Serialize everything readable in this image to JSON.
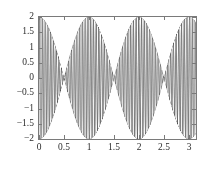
{
  "chart_data": {
    "type": "line",
    "title": "",
    "subtitle": "",
    "xlabel": "",
    "ylabel": "",
    "xlim": [
      0,
      3.141592653589793
    ],
    "ylim": [
      -2,
      2
    ],
    "grid": false,
    "legend": null,
    "envelope": {
      "formula": "2*cos(pi*x)",
      "amplitude": 2,
      "node_x": [
        0.5,
        1.5,
        2.5
      ],
      "antinode_x": [
        0,
        1,
        2,
        3
      ],
      "antinode_y": [
        2,
        2,
        2,
        2
      ]
    },
    "carrier": {
      "formula": "sin(200*x)",
      "relative_frequency": 200
    },
    "series": [
      {
        "name": "y = 2*cos(pi*x)*sin(200*x)",
        "color": "#3a3a3a",
        "x": [
          0,
          0.25,
          0.5,
          0.75,
          1,
          1.25,
          1.5,
          1.75,
          2,
          2.25,
          2.5,
          2.75,
          3,
          3.1416
        ],
        "envelope_upper": [
          2,
          1.414,
          0,
          1.414,
          2,
          1.414,
          0,
          1.414,
          2,
          1.414,
          0,
          1.414,
          2,
          2
        ],
        "envelope_lower": [
          -2,
          -1.414,
          0,
          -1.414,
          -2,
          -1.414,
          0,
          -1.414,
          -2,
          -1.414,
          0,
          -1.414,
          -2,
          -2
        ]
      }
    ],
    "xticks": [
      {
        "value": 0,
        "label": "0"
      },
      {
        "value": 0.5,
        "label": "0.5"
      },
      {
        "value": 1,
        "label": "1"
      },
      {
        "value": 1.5,
        "label": "1.5"
      },
      {
        "value": 2,
        "label": "2"
      },
      {
        "value": 2.5,
        "label": "2.5"
      },
      {
        "value": 3,
        "label": "3"
      }
    ],
    "yticks": [
      {
        "value": 2,
        "label": "2"
      },
      {
        "value": 1.5,
        "label": "1.5"
      },
      {
        "value": 1,
        "label": "1"
      },
      {
        "value": 0.5,
        "label": "0.5"
      },
      {
        "value": 0,
        "label": "0"
      },
      {
        "value": -0.5,
        "label": "−0.5"
      },
      {
        "value": -1,
        "label": "−1"
      },
      {
        "value": -1.5,
        "label": "−1.5"
      },
      {
        "value": -2,
        "label": "−2"
      }
    ],
    "colors": {
      "trace": "#3a3a3a",
      "axis": "#7a7a7a",
      "tick_text": "#2b2b2b",
      "background": "#ffffff"
    }
  }
}
